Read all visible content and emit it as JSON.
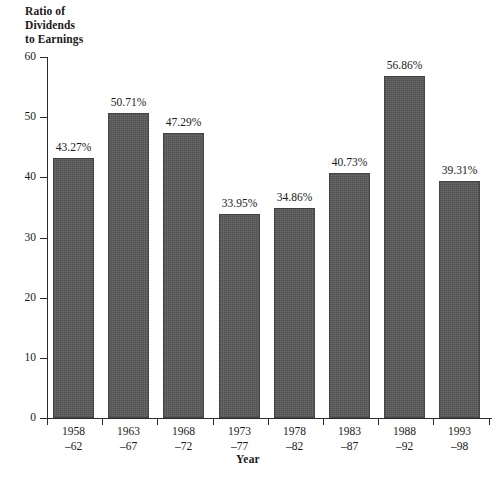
{
  "chart_data": {
    "type": "bar",
    "title": "",
    "ylabel": "Ratio of Dividends to Earnings",
    "ylabel_lines": [
      "Ratio of",
      "Dividends",
      "to Earnings"
    ],
    "xlabel": "Year",
    "ylim": [
      0,
      60
    ],
    "yticks": [
      0,
      10,
      20,
      30,
      40,
      50,
      60
    ],
    "ytick_labels": [
      "0",
      "10",
      "20",
      "30",
      "40",
      "50",
      "60"
    ],
    "grid": false,
    "legend": "none",
    "bar_color": "#585858",
    "axis_color": "#2b2b2b",
    "categories": [
      "1958–62",
      "1963–67",
      "1968–72",
      "1973–77",
      "1978–82",
      "1983–87",
      "1988–92",
      "1993–98"
    ],
    "category_lines": [
      {
        "line1": "1958",
        "line2": "–62"
      },
      {
        "line1": "1963",
        "line2": "–67"
      },
      {
        "line1": "1968",
        "line2": "–72"
      },
      {
        "line1": "1973",
        "line2": "–77"
      },
      {
        "line1": "1978",
        "line2": "–82"
      },
      {
        "line1": "1983",
        "line2": "–87"
      },
      {
        "line1": "1988",
        "line2": "–92"
      },
      {
        "line1": "1993",
        "line2": "–98"
      }
    ],
    "values": [
      43.27,
      50.71,
      47.29,
      33.95,
      34.86,
      40.73,
      56.86,
      39.31
    ],
    "value_labels": [
      "43.27%",
      "50.71%",
      "47.29%",
      "33.95%",
      "34.86%",
      "40.73%",
      "56.86%",
      "39.31%"
    ]
  }
}
